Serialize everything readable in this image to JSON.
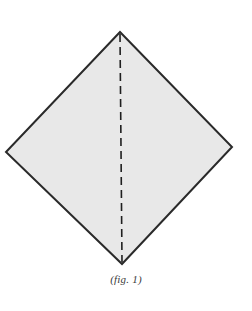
{
  "figure": {
    "caption": "(fig. 1)",
    "kind": "origami-fold-diagram",
    "step_number": "1",
    "background_color": "#ffffff",
    "canvas": {
      "width": 252,
      "height": 311
    },
    "paper": {
      "name": "square-sheet-rotated-45",
      "shape": "diamond",
      "fill_color": "#e8e8e8",
      "stroke_color": "#2a2a2a",
      "stroke_width": 2,
      "vertices": {
        "top": {
          "x": 120,
          "y": 32
        },
        "right": {
          "x": 232,
          "y": 147
        },
        "bottom": {
          "x": 122,
          "y": 264
        },
        "left": {
          "x": 6,
          "y": 152
        }
      },
      "outline_points": "120,32 232,147 122,264 6,152"
    },
    "fold_line": {
      "name": "vertical-valley-fold",
      "style": "dashed",
      "stroke_color": "#1f1f1f",
      "stroke_width": 1.6,
      "dash_pattern": "8 5",
      "from": {
        "x": 120,
        "y": 34
      },
      "to": {
        "x": 122,
        "y": 262
      }
    }
  }
}
